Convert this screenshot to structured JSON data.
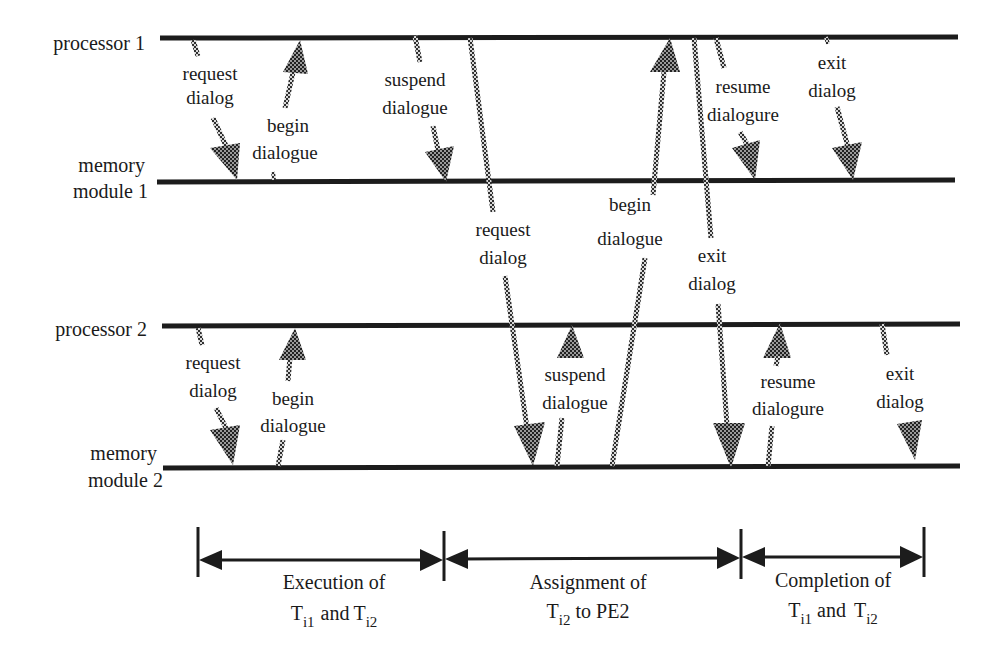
{
  "colors": {
    "line": "#1c1c1c",
    "arrow_fill": "#3a3a3a",
    "arrow_light": "#bdbdbd",
    "background": "#ffffff",
    "text": "#1a1a1a"
  },
  "lanes": [
    {
      "id": "p1",
      "label_lines": [
        "processor 1"
      ],
      "y": 38
    },
    {
      "id": "m1",
      "label_lines": [
        "memory",
        "module 1"
      ],
      "y": 181
    },
    {
      "id": "p2",
      "label_lines": [
        "processor 2"
      ],
      "y": 324
    },
    {
      "id": "m2",
      "label_lines": [
        "memory",
        "module 2"
      ],
      "y": 466
    }
  ],
  "labels": {
    "p1": "processor 1",
    "m1_a": "memory",
    "m1_b": "module 1",
    "p2": "processor 2",
    "m2_a": "memory",
    "m2_b": "module 2"
  },
  "messages": [
    {
      "id": "p1-request",
      "from": "processor 1",
      "to": "memory module 1",
      "label_lines": [
        "request",
        "dialog"
      ]
    },
    {
      "id": "m1-begin",
      "from": "memory module 1",
      "to": "processor 1",
      "label_lines": [
        "begin",
        "dialogue"
      ]
    },
    {
      "id": "p1-suspend",
      "from": "processor 1",
      "to": "memory module 1",
      "label_lines": [
        "suspend",
        "dialogue"
      ]
    },
    {
      "id": "p1-request-m2",
      "from": "processor 1",
      "to": "memory module 2",
      "label_lines": [
        "request",
        "dialog"
      ]
    },
    {
      "id": "m2-begin-p1",
      "from": "memory module 2",
      "to": "processor 1",
      "label_lines": [
        "begin",
        "dialogue"
      ]
    },
    {
      "id": "p1-exit-m2",
      "from": "processor 1",
      "to": "memory module 2",
      "label_lines": [
        "exit",
        "dialog"
      ]
    },
    {
      "id": "p1-resume",
      "from": "processor 1",
      "to": "memory module 1",
      "label_lines": [
        "resume",
        "dialogure"
      ]
    },
    {
      "id": "p1-exit",
      "from": "processor 1",
      "to": "memory module 1",
      "label_lines": [
        "exit",
        "dialog"
      ]
    },
    {
      "id": "p2-request",
      "from": "processor 2",
      "to": "memory module 2",
      "label_lines": [
        "request",
        "dialog"
      ]
    },
    {
      "id": "m2-begin",
      "from": "memory module 2",
      "to": "processor 2",
      "label_lines": [
        "begin",
        "dialogue"
      ]
    },
    {
      "id": "m2-suspend",
      "from": "memory module 2",
      "to": "processor 2",
      "label_lines": [
        "suspend",
        "dialogue"
      ]
    },
    {
      "id": "m2-resume",
      "from": "memory module 2",
      "to": "processor 2",
      "label_lines": [
        "resume",
        "dialogure"
      ]
    },
    {
      "id": "p2-exit",
      "from": "processor 2",
      "to": "memory module 2",
      "label_lines": [
        "exit",
        "dialog"
      ]
    }
  ],
  "msg": {
    "request": "request",
    "dialog": "dialog",
    "begin": "begin",
    "dialogue": "dialogue",
    "suspend": "suspend",
    "resume": "resume",
    "dialogure": "dialogure",
    "exit": "exit"
  },
  "phases": [
    {
      "id": "execution",
      "line1": "Execution of",
      "line2_parts": [
        "T",
        "i1",
        " and ",
        "T",
        "i2"
      ],
      "x_start": 198,
      "x_end": 444
    },
    {
      "id": "assignment",
      "line1": "Assignment of",
      "line2_parts": [
        "T",
        "i2",
        " to PE2"
      ],
      "x_start": 444,
      "x_end": 741
    },
    {
      "id": "completion",
      "line1": "Completion of",
      "line2_parts": [
        "T",
        "i1",
        " and ",
        "T",
        "i2"
      ],
      "x_start": 741,
      "x_end": 924
    }
  ],
  "phase_text": {
    "exec_1": "Execution of",
    "assign_1": "Assignment of",
    "comp_1": "Completion of",
    "T": "T",
    "i1": "i1",
    "i2": "i2",
    "and": "and",
    "to_pe2": "to PE2"
  }
}
